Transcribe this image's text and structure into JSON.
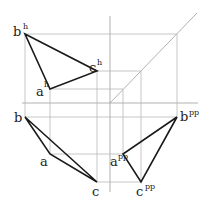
{
  "diagram": {
    "colors": {
      "lines": "#1a1a1a",
      "guides": "#b8b8b8",
      "background": "#ffffff"
    },
    "axes": {
      "horizontal": {
        "x1": 22,
        "y1": 103,
        "x2": 198,
        "y2": 103
      },
      "vertical": {
        "x1": 110,
        "y1": 16,
        "x2": 110,
        "y2": 192
      },
      "diagonal": {
        "x1": 110,
        "y1": 103,
        "x2": 197,
        "y2": 13
      }
    },
    "points": {
      "a_h": {
        "label": "a",
        "sup": "h",
        "x": 50,
        "y": 89
      },
      "b_h": {
        "label": "b",
        "sup": "h",
        "x": 25,
        "y": 34
      },
      "c_h": {
        "label": "c",
        "sup": "h",
        "x": 97,
        "y": 71
      },
      "a": {
        "label": "a",
        "sup": "",
        "x": 50,
        "y": 154
      },
      "b": {
        "label": "b",
        "sup": "",
        "x": 25,
        "y": 117
      },
      "c": {
        "label": "c",
        "sup": "",
        "x": 97,
        "y": 182
      },
      "a_pp": {
        "label": "a",
        "sup": "pp",
        "x": 123,
        "y": 154
      },
      "b_pp": {
        "label": "b",
        "sup": "pp",
        "x": 177,
        "y": 117
      },
      "c_pp": {
        "label": "c",
        "sup": "pp",
        "x": 141,
        "y": 182
      }
    },
    "labels": {
      "b_h": "b",
      "b_h_sup": "h",
      "c_h": "c",
      "c_h_sup": "h",
      "a_h": "a",
      "a_h_sup": "h",
      "b": "b",
      "a": "a",
      "c": "c",
      "b_pp": "b",
      "b_pp_sup": "pp",
      "a_pp": "a",
      "a_pp_sup": "pp",
      "c_pp": "c",
      "c_pp_sup": "pp"
    }
  }
}
